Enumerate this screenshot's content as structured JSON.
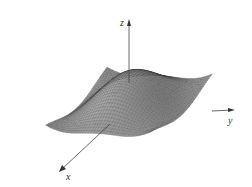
{
  "chart_data": {
    "type": "surface",
    "title": "",
    "axes": {
      "x": {
        "label": "x"
      },
      "y": {
        "label": "y"
      },
      "z": {
        "label": "z"
      }
    },
    "surface": {
      "description": "Wireframe mesh surface with a central dome and saddle-like troughs, raised ridges at left-back and right-back edges",
      "grid": {
        "u_steps": 40,
        "v_steps": 40
      },
      "domain": {
        "x": [
          -2.2,
          2.2
        ],
        "y": [
          -2.2,
          2.2
        ]
      },
      "function_hint": "z = sin/cos wave surface (e.g. z = cos(x) * cos(y) type oscillation)"
    },
    "grid": false,
    "legend": null
  },
  "colors": {
    "background": "#ffffff",
    "mesh_line": "#2a2a2a",
    "surface_light": "#e6e6e6",
    "surface_dark": "#3a3a3a",
    "axis": "#444444"
  }
}
